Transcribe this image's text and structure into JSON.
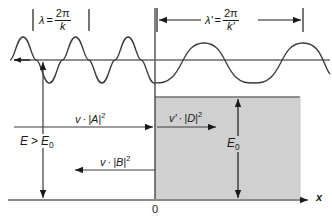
{
  "figure": {
    "colors": {
      "line": "#1a1a1a",
      "wave": "#333333",
      "step_fill": "#d0d0d0",
      "step_edge": "#808080",
      "axis": "#808080",
      "background": "#ffffff"
    },
    "labels": {
      "lambda_left_symbol": "λ",
      "lambda_left_equals": "=",
      "lambda_left_numerator": "2π",
      "lambda_left_denominator": "k",
      "lambda_right_symbol": "λ'",
      "lambda_right_equals": "=",
      "lambda_right_numerator": "2π",
      "lambda_right_denominator": "k'",
      "incident_flux_velocity": "v",
      "incident_flux_dot": "·",
      "incident_flux_amplitude": "|A|",
      "incident_flux_power": "2",
      "reflected_flux_velocity": "v",
      "reflected_flux_dot": "·",
      "reflected_flux_amplitude": "|B|",
      "reflected_flux_power": "2",
      "transmitted_flux_velocity": "v'",
      "transmitted_flux_dot": "·",
      "transmitted_flux_amplitude": "|D|",
      "transmitted_flux_power": "2",
      "energy_relation_E": "E",
      "energy_relation_op": ">",
      "energy_relation_E0": "E",
      "energy_relation_E0_sub": "0",
      "step_height_E0": "E",
      "step_height_E0_sub": "0",
      "origin": "0",
      "x_axis": "x"
    },
    "geometry": {
      "boundary_x": 155,
      "baseline_y": 200,
      "wave_axis_y": 60,
      "step_top_y": 97,
      "step_right_x": 300,
      "left_wavelength_px": 37,
      "right_wavelength_px": 98,
      "left_amplitude_px": 23,
      "right_amplitude_px": 17,
      "incident_arrow_y": 127,
      "reflected_arrow_y": 170,
      "transmitted_arrow_y": 127,
      "energy_arrow_x": 43,
      "step_arrow_x": 238
    }
  }
}
